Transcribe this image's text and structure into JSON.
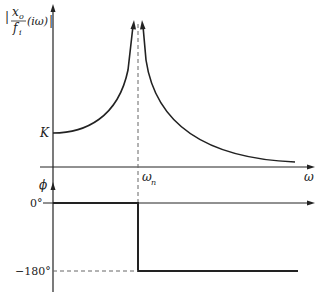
{
  "magnitude_plot": {
    "ylabel_num": "x",
    "ylabel_num_sub": "o",
    "ylabel_den": "f",
    "ylabel_den_sub": "i",
    "ylabel_suffix": "(iω)",
    "k_label": "K",
    "resonance_label": "ω",
    "resonance_sub": "n",
    "xlabel": "ω"
  },
  "phase_plot": {
    "ylabel": "ϕ",
    "tick_0": "0°",
    "tick_neg180": "−180°"
  },
  "colors": {
    "stroke": "#222222",
    "dashed": "#555555"
  }
}
